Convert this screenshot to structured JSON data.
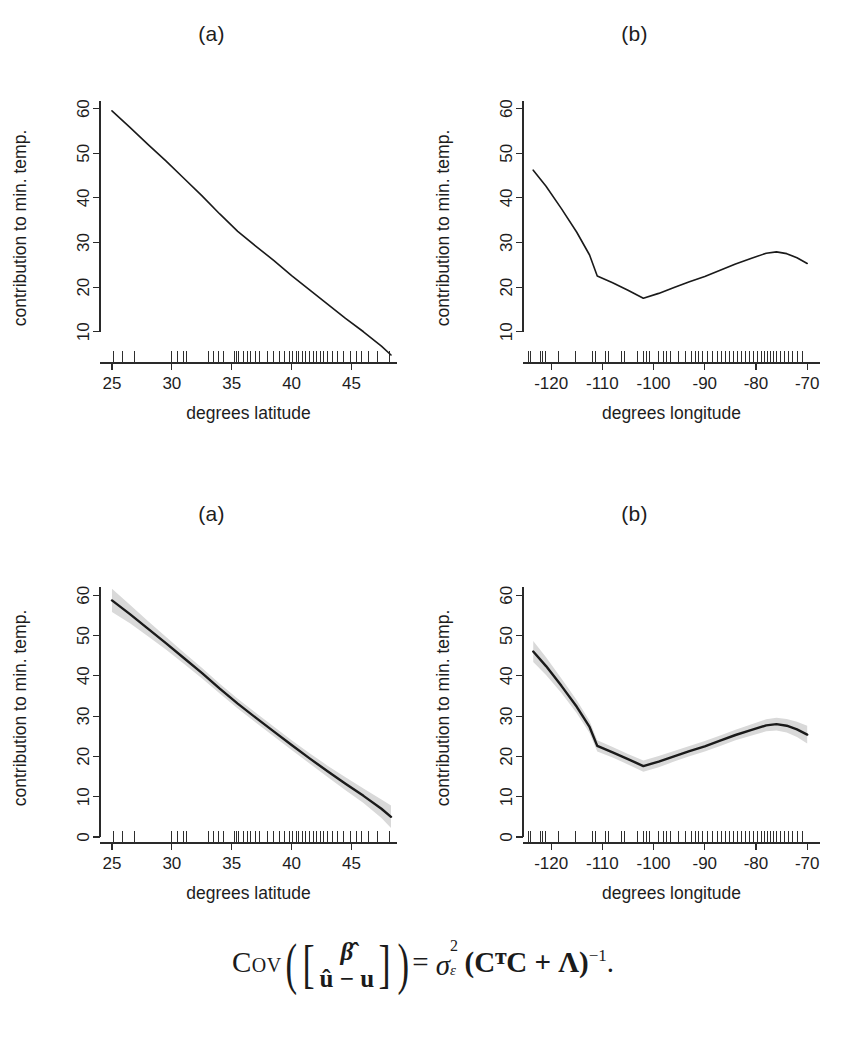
{
  "figure": {
    "background": "#ffffff",
    "line_color": "#1a1a1a",
    "band_color": "#d9d9d9",
    "panel_titles": {
      "a": "(a)",
      "b": "(b)"
    },
    "formula": {
      "operator": "Cov",
      "numerator_row": "β̂",
      "denominator_row": "û − u",
      "equals": "=",
      "sigma": "σ",
      "sigma_sup": "2",
      "sigma_sub": "ε",
      "matrix_expr": "(CᵀC + Λ)",
      "exponent": "−1",
      "period": ".",
      "plain_text": "Cov([β̂ ; û − u]) = σ²_ε (CᵀC + Λ)⁻¹."
    },
    "caption_partial": ""
  },
  "chart_data": [
    {
      "id": "top-a",
      "type": "line",
      "title": "(a)",
      "xlabel": "degrees latitude",
      "ylabel": "contribution to min. temp.",
      "xlim": [
        24.0,
        48.8
      ],
      "ylim": [
        3.0,
        63.5
      ],
      "xticks": [
        25,
        30,
        35,
        40,
        45
      ],
      "yticks": [
        10,
        20,
        30,
        40,
        50,
        60
      ],
      "grid": false,
      "legend": "none",
      "has_band": false,
      "x": [
        25.0,
        26.5,
        28.0,
        29.5,
        31.0,
        32.5,
        34.0,
        35.5,
        37.0,
        38.5,
        40.0,
        41.5,
        43.0,
        44.5,
        46.0,
        47.5,
        48.3
      ],
      "y": [
        59.5,
        55.8,
        52.0,
        48.3,
        44.4,
        40.5,
        36.4,
        32.5,
        29.2,
        26.0,
        22.6,
        19.4,
        16.2,
        13.0,
        10.0,
        6.8,
        4.8
      ],
      "rug_x": [
        25.1,
        25.9,
        26.9,
        30.0,
        30.5,
        31.0,
        31.2,
        33.1,
        33.5,
        33.9,
        34.3,
        35.2,
        35.4,
        35.6,
        36.0,
        36.3,
        36.6,
        37.0,
        37.3,
        38.0,
        38.5,
        39.0,
        39.4,
        39.8,
        40.1,
        40.4,
        40.6,
        40.9,
        41.2,
        41.5,
        41.8,
        42.1,
        42.4,
        42.7,
        43.0,
        43.4,
        43.8,
        44.3,
        44.9,
        45.4,
        45.8,
        46.4,
        47.2,
        48.2
      ]
    },
    {
      "id": "top-b",
      "type": "line",
      "title": "(b)",
      "xlabel": "degrees longitude",
      "ylabel": "contribution to min. temp.",
      "xlim": [
        -125.5,
        -67.5
      ],
      "ylim": [
        3.0,
        63.5
      ],
      "xticks": [
        -120,
        -110,
        -100,
        -90,
        -80,
        -70
      ],
      "yticks": [
        10,
        20,
        30,
        40,
        50,
        60
      ],
      "grid": false,
      "legend": "none",
      "has_band": false,
      "x": [
        -123.5,
        -121.0,
        -118.0,
        -115.0,
        -112.5,
        -111.0,
        -108.0,
        -105.0,
        -102.0,
        -99.0,
        -96.0,
        -93.0,
        -90.0,
        -87.0,
        -84.0,
        -81.0,
        -78.0,
        -76.0,
        -74.0,
        -72.0,
        -70.0
      ],
      "y": [
        46.2,
        42.6,
        37.6,
        32.3,
        27.2,
        22.5,
        21.0,
        19.3,
        17.5,
        18.6,
        19.9,
        21.2,
        22.4,
        23.8,
        25.2,
        26.4,
        27.6,
        27.9,
        27.5,
        26.6,
        25.3
      ],
      "rug_x": [
        -124.4,
        -124.0,
        -122.1,
        -121.6,
        -121.1,
        -118.5,
        -115.2,
        -112.0,
        -111.4,
        -109.3,
        -108.8,
        -106.2,
        -105.6,
        -103.2,
        -102.0,
        -101.3,
        -100.8,
        -99.1,
        -98.1,
        -97.4,
        -96.6,
        -95.2,
        -93.8,
        -92.6,
        -91.9,
        -91.2,
        -90.4,
        -89.4,
        -88.4,
        -87.6,
        -86.8,
        -85.9,
        -85.1,
        -84.3,
        -83.6,
        -82.8,
        -82.0,
        -81.2,
        -80.4,
        -79.7,
        -79.0,
        -78.4,
        -77.8,
        -77.2,
        -76.6,
        -76.0,
        -75.3,
        -74.4,
        -73.6,
        -72.8,
        -71.9,
        -70.9
      ]
    },
    {
      "id": "bottom-a",
      "type": "line",
      "title": "(a)",
      "xlabel": "degrees latitude",
      "ylabel": "contribution to min. temp.",
      "xlim": [
        24.0,
        48.8
      ],
      "ylim": [
        -1.5,
        65.5
      ],
      "xticks": [
        25,
        30,
        35,
        40,
        45
      ],
      "yticks": [
        0,
        10,
        20,
        30,
        40,
        50,
        60
      ],
      "grid": false,
      "legend": "none",
      "has_band": true,
      "band_label": "confidence band",
      "x": [
        25.0,
        26.5,
        28.0,
        29.5,
        31.0,
        32.5,
        34.0,
        35.5,
        37.0,
        38.5,
        40.0,
        41.5,
        43.0,
        44.5,
        46.0,
        47.5,
        48.3
      ],
      "y": [
        58.7,
        55.3,
        51.7,
        48.1,
        44.4,
        40.7,
        36.8,
        33.1,
        29.6,
        26.2,
        22.8,
        19.5,
        16.3,
        13.2,
        10.2,
        7.0,
        5.0
      ],
      "y_upper": [
        61.6,
        57.6,
        53.6,
        49.7,
        45.8,
        42.0,
        38.0,
        34.3,
        30.8,
        27.4,
        24.0,
        20.8,
        17.7,
        14.8,
        12.0,
        9.3,
        7.8
      ],
      "y_lower": [
        55.8,
        53.0,
        49.8,
        46.5,
        43.0,
        39.4,
        35.6,
        31.9,
        28.4,
        25.0,
        21.6,
        18.2,
        14.9,
        11.6,
        8.4,
        4.7,
        2.2
      ],
      "rug_x": [
        25.1,
        25.9,
        26.9,
        30.0,
        30.5,
        31.0,
        31.2,
        33.1,
        33.5,
        33.9,
        34.3,
        35.2,
        35.4,
        35.6,
        36.0,
        36.3,
        36.6,
        37.0,
        37.3,
        38.0,
        38.5,
        39.0,
        39.4,
        39.8,
        40.1,
        40.4,
        40.6,
        40.9,
        41.2,
        41.5,
        41.8,
        42.1,
        42.4,
        42.7,
        43.0,
        43.4,
        43.8,
        44.3,
        44.9,
        45.4,
        45.8,
        46.4,
        47.2,
        48.2
      ]
    },
    {
      "id": "bottom-b",
      "type": "line",
      "title": "(b)",
      "xlabel": "degrees longitude",
      "ylabel": "contribution to min. temp.",
      "xlim": [
        -125.5,
        -67.5
      ],
      "ylim": [
        -1.5,
        65.5
      ],
      "xticks": [
        -120,
        -110,
        -100,
        -90,
        -80,
        -70
      ],
      "yticks": [
        0,
        10,
        20,
        30,
        40,
        50,
        60
      ],
      "grid": false,
      "legend": "none",
      "has_band": true,
      "band_label": "confidence band",
      "x": [
        -123.5,
        -121.0,
        -118.0,
        -115.0,
        -112.5,
        -111.0,
        -108.0,
        -105.0,
        -102.0,
        -99.0,
        -96.0,
        -93.0,
        -90.0,
        -87.0,
        -84.0,
        -81.0,
        -78.0,
        -76.0,
        -74.0,
        -72.0,
        -70.0
      ],
      "y": [
        46.0,
        42.4,
        37.5,
        32.3,
        27.3,
        22.6,
        21.0,
        19.3,
        17.6,
        18.7,
        20.0,
        21.3,
        22.5,
        23.9,
        25.3,
        26.5,
        27.7,
        28.0,
        27.6,
        26.7,
        25.4
      ],
      "y_upper": [
        48.6,
        44.6,
        39.3,
        33.9,
        28.8,
        24.0,
        22.3,
        20.6,
        19.0,
        20.1,
        21.3,
        22.6,
        23.8,
        25.2,
        26.6,
        27.9,
        29.2,
        29.6,
        29.3,
        28.6,
        27.6
      ],
      "y_lower": [
        43.4,
        40.2,
        35.7,
        30.7,
        25.8,
        21.2,
        19.7,
        18.0,
        16.2,
        17.3,
        18.7,
        20.0,
        21.2,
        22.6,
        24.0,
        25.1,
        26.2,
        26.4,
        25.9,
        24.8,
        23.2
      ],
      "rug_x": [
        -124.4,
        -124.0,
        -122.1,
        -121.6,
        -121.1,
        -118.5,
        -115.2,
        -112.0,
        -111.4,
        -109.3,
        -108.8,
        -106.2,
        -105.6,
        -103.2,
        -102.0,
        -101.3,
        -100.8,
        -99.1,
        -98.1,
        -97.4,
        -96.6,
        -95.2,
        -93.8,
        -92.6,
        -91.9,
        -91.2,
        -90.4,
        -89.4,
        -88.4,
        -87.6,
        -86.8,
        -85.9,
        -85.1,
        -84.3,
        -83.6,
        -82.8,
        -82.0,
        -81.2,
        -80.4,
        -79.7,
        -79.0,
        -78.4,
        -77.8,
        -77.2,
        -76.6,
        -76.0,
        -75.3,
        -74.4,
        -73.6,
        -72.8,
        -71.9,
        -70.9
      ]
    }
  ]
}
